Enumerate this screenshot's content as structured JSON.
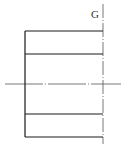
{
  "diagram": {
    "label_g": "G",
    "colors": {
      "stroke": "#1a1a1a",
      "centerline": "#555555",
      "background": "#ffffff"
    }
  }
}
